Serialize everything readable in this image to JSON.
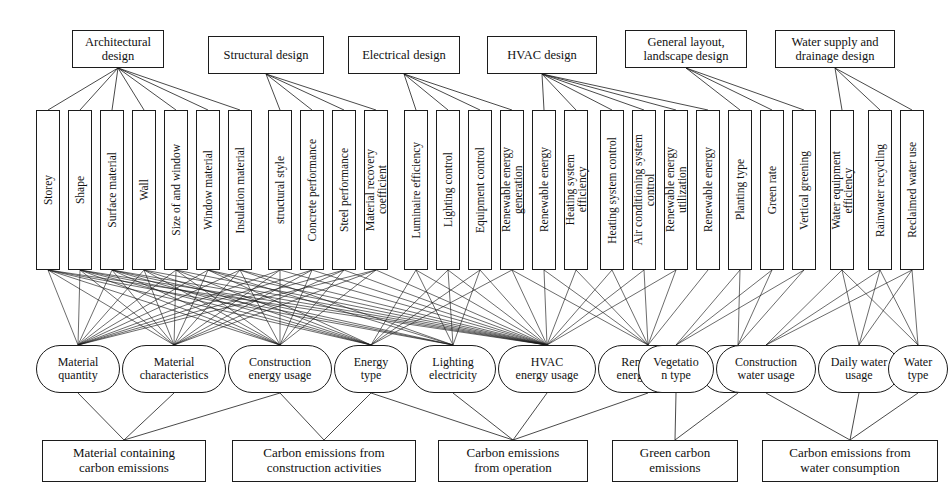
{
  "diagram": {
    "line_color": "#1c1c1c",
    "fill_color": "#ffffff"
  },
  "design_stages": [
    {
      "label": "Architectural\ndesign",
      "x": 72,
      "y": 30,
      "w": 92
    },
    {
      "label": "Structural design",
      "x": 208,
      "y": 36,
      "w": 116
    },
    {
      "label": "Electrical design",
      "x": 348,
      "y": 36,
      "w": 112
    },
    {
      "label": "HVAC design",
      "x": 487,
      "y": 36,
      "w": 110
    },
    {
      "label": "General layout,\nlandscape design",
      "x": 625,
      "y": 30,
      "w": 122
    },
    {
      "label": "Water supply and\ndrainage design",
      "x": 775,
      "y": 30,
      "w": 120
    }
  ],
  "parameters": [
    {
      "label": "Storey",
      "x": 36,
      "group": "architectural"
    },
    {
      "label": "Shape",
      "x": 68,
      "group": "architectural"
    },
    {
      "label": "Surface material",
      "x": 100,
      "group": "architectural"
    },
    {
      "label": "Wall",
      "x": 132,
      "group": "architectural"
    },
    {
      "label": "Size of and window",
      "x": 164,
      "group": "architectural"
    },
    {
      "label": "Window material",
      "x": 196,
      "group": "architectural"
    },
    {
      "label": "Insulation material",
      "x": 228,
      "group": "architectural"
    },
    {
      "label": "structural style",
      "x": 268,
      "group": "structural"
    },
    {
      "label": "Concrete performance",
      "x": 300,
      "group": "structural"
    },
    {
      "label": "Steel performance",
      "x": 332,
      "group": "structural"
    },
    {
      "label": "Material recovery\ncoefficient",
      "x": 364,
      "group": "structural"
    },
    {
      "label": "Luminaire efficiency",
      "x": 404,
      "group": "electrical"
    },
    {
      "label": "Lighting control",
      "x": 436,
      "group": "electrical"
    },
    {
      "label": "Equipment control",
      "x": 468,
      "group": "electrical"
    },
    {
      "label": "Renewable energy\ngeneration",
      "x": 500,
      "group": "electrical"
    },
    {
      "label": "Renewable energy",
      "x": 532,
      "group": "hvac"
    },
    {
      "label": "Heating system\nefficiency",
      "x": 564,
      "group": "hvac"
    },
    {
      "label": "Heating system control",
      "x": 600,
      "group": "hvac"
    },
    {
      "label": "Air conditioning system\ncontrol",
      "x": 632,
      "group": "hvac"
    },
    {
      "label": "Renewable energy\nutilization",
      "x": 664,
      "group": "hvac"
    },
    {
      "label": "Renewable energy",
      "x": 696,
      "group": "hvac"
    },
    {
      "label": "Planting type",
      "x": 728,
      "group": "layout"
    },
    {
      "label": "Green rate",
      "x": 760,
      "group": "layout"
    },
    {
      "label": "Vertical greening",
      "x": 792,
      "group": "layout"
    },
    {
      "label": "Water equipment\nefficiency",
      "x": 830,
      "group": "water"
    },
    {
      "label": "Rainwater recycling",
      "x": 868,
      "group": "water"
    },
    {
      "label": "Reclaimed water use",
      "x": 900,
      "group": "water"
    }
  ],
  "indicators": [
    {
      "label": "Material\nquantity",
      "x": 36,
      "w": 84
    },
    {
      "label": "Material\ncharacteristics",
      "x": 122,
      "w": 104
    },
    {
      "label": "Construction\nenergy usage",
      "x": 228,
      "w": 104
    },
    {
      "label": "Energy\ntype",
      "x": 334,
      "w": 74
    },
    {
      "label": "Lighting\nelectricity",
      "x": 410,
      "w": 86
    },
    {
      "label": "HVAC\nenergy usage",
      "x": 498,
      "w": 98
    },
    {
      "label": "Renewable\nenergy usage",
      "x": 598,
      "w": 100
    },
    {
      "label": "Afforest\ned area",
      "x": 700,
      "w": 76
    },
    {
      "label": "Vegetatio\nn type",
      "x": 638,
      "w": 76
    },
    {
      "label": "Construction\nwater usage",
      "x": 716,
      "w": 100
    },
    {
      "label": "Daily water\nusage",
      "x": 818,
      "w": 82
    },
    {
      "label": "Water\ntype",
      "x": 888,
      "w": 60
    }
  ],
  "emission_categories": [
    {
      "label": "Material containing\ncarbon emissions",
      "x": 42,
      "w": 164
    },
    {
      "label": "Carbon emissions from\nconstruction activities",
      "x": 232,
      "w": 184
    },
    {
      "label": "Carbon emissions\nfrom operation",
      "x": 438,
      "w": 150
    },
    {
      "label": "Green carbon\nemissions",
      "x": 612,
      "w": 126
    },
    {
      "label": "Carbon emissions from\nwater consumption",
      "x": 762,
      "w": 176
    }
  ],
  "geometry": {
    "top_row_bottom_y": 68,
    "vert_row_top_y": 110,
    "vert_row_bottom_y": 270,
    "ind_row_top_y": 345,
    "ind_row_bottom_y": 393,
    "bot_row_top_y": 440
  }
}
